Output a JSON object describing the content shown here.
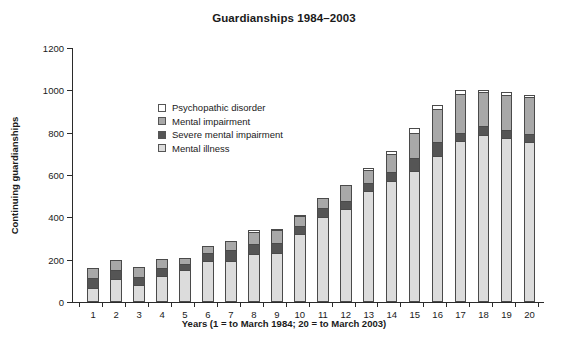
{
  "chart_data": {
    "type": "bar",
    "subtype": "stacked-bar",
    "title": "Guardianships 1984–2003",
    "xlabel": "Years (1 = to March 1984; 20 = to March 2003)",
    "ylabel": "Continuing guardianships",
    "ylim": [
      0,
      1200
    ],
    "ytick_step": 200,
    "yticks": [
      0,
      200,
      400,
      600,
      800,
      1000,
      1200
    ],
    "ytick_labels": [
      "0",
      "200",
      "400",
      "600",
      "800",
      "1000",
      "1200"
    ],
    "grid": false,
    "legend_position": "upper-left-inside",
    "categories": [
      "1",
      "2",
      "3",
      "4",
      "5",
      "6",
      "7",
      "8",
      "9",
      "10",
      "11",
      "12",
      "13",
      "14",
      "15",
      "16",
      "17",
      "18",
      "19",
      "20"
    ],
    "stack_order_bottom_to_top": [
      "Mental illness",
      "Severe mental impairment",
      "Mental impairment",
      "Psychopathic disorder"
    ],
    "series": [
      {
        "name": "Mental illness",
        "color": "#dcdcdc",
        "values": [
          65,
          110,
          80,
          125,
          150,
          195,
          195,
          225,
          230,
          320,
          400,
          440,
          525,
          570,
          620,
          690,
          760,
          790,
          775,
          755
        ]
      },
      {
        "name": "Severe mental impairment",
        "color": "#555555",
        "values": [
          50,
          40,
          40,
          35,
          30,
          35,
          50,
          50,
          50,
          40,
          45,
          35,
          35,
          45,
          60,
          65,
          40,
          40,
          40,
          40
        ]
      },
      {
        "name": "Mental impairment",
        "color": "#a8a8a8",
        "values": [
          45,
          50,
          45,
          45,
          30,
          35,
          45,
          55,
          60,
          45,
          45,
          80,
          65,
          85,
          120,
          155,
          185,
          160,
          165,
          175
        ]
      },
      {
        "name": "Psychopathic disorder",
        "color": "#ffffff",
        "values": [
          0,
          0,
          0,
          0,
          0,
          0,
          0,
          10,
          5,
          5,
          0,
          0,
          10,
          15,
          20,
          20,
          15,
          10,
          10,
          10
        ]
      }
    ],
    "totals": [
      160,
      200,
      165,
      205,
      210,
      265,
      290,
      340,
      345,
      410,
      490,
      555,
      635,
      715,
      820,
      930,
      1000,
      1000,
      990,
      980
    ]
  },
  "legend": {
    "items": [
      {
        "label": "Psychopathic disorder",
        "color": "#ffffff"
      },
      {
        "label": "Mental impairment",
        "color": "#a8a8a8"
      },
      {
        "label": "Severe mental impairment",
        "color": "#555555"
      },
      {
        "label": "Mental illness",
        "color": "#dcdcdc"
      }
    ]
  }
}
